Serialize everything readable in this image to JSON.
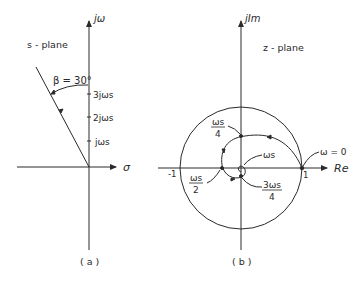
{
  "figure_a": {
    "plane_label": "s - plane",
    "vertical_axis_label": "jω",
    "horizontal_axis_label": "σ",
    "angle_label": "β = 30°",
    "ticks": [
      "3jωs",
      "2jωs",
      "jωs"
    ],
    "caption": "( a )"
  },
  "figure_b": {
    "plane_label": "z - plane",
    "vertical_axis_label": "jIm",
    "horizontal_axis_label": "Re",
    "minus_one": "-1",
    "one": "1",
    "omega_zero": "ω = 0",
    "ws4_num": "ωs",
    "ws4_den": "4",
    "ws2_num": "ωs",
    "ws2_den": "2",
    "ws": "ωs",
    "w3s4_num": "3ωs",
    "w3s4_den": "4",
    "caption": "( b )"
  },
  "colors": {
    "ink": "#2a2a2a",
    "background": "#ffffff"
  }
}
